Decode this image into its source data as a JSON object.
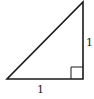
{
  "diagram": {
    "type": "right-triangle",
    "vertices": {
      "bottom_left": [
        7,
        79
      ],
      "right_angle": [
        83,
        79
      ],
      "top": [
        83,
        2
      ]
    },
    "right_angle_marker": {
      "x": 71,
      "y": 67,
      "size": 12
    },
    "labels": {
      "vertical_leg": "1",
      "horizontal_leg": "1"
    },
    "stroke_color": "#1a1a1a"
  }
}
